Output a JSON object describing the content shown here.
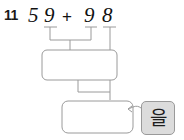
{
  "worksheet": {
    "problem_number": "11",
    "equation": {
      "addend1_tens": "5",
      "addend1_ones": "9",
      "operator": "+",
      "addend2_tens": "9",
      "addend2_ones": "8"
    },
    "boxes": {
      "middle_answer_box": "",
      "bottom_answer_box": ""
    },
    "tool_button": {
      "glyph": "그",
      "icon_name": "korean-keyboard-icon",
      "label": "을"
    },
    "colors": {
      "line": "#9a9a9a",
      "box_border": "#9a9a9a",
      "tool_fill": "#dcdcdc",
      "text": "#111111",
      "page_bg": "#ffffff"
    }
  }
}
